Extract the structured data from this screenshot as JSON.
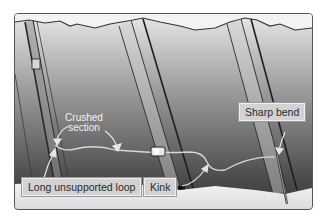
{
  "figure": {
    "labels": {
      "crushed_section": "Crushed\nsection",
      "crushed_section_line1": "Crushed",
      "crushed_section_line2": "section",
      "sharp_bend": "Sharp bend",
      "long_unsupported_loop": "Long unsupported loop",
      "kink": "Kink"
    },
    "colors": {
      "frame_border": "#555555",
      "label_bg": "#d2d2d2",
      "label_text": "#2a2a2a",
      "callout_text": "#f2f2f2",
      "arrow": "#e6e6e6"
    }
  }
}
